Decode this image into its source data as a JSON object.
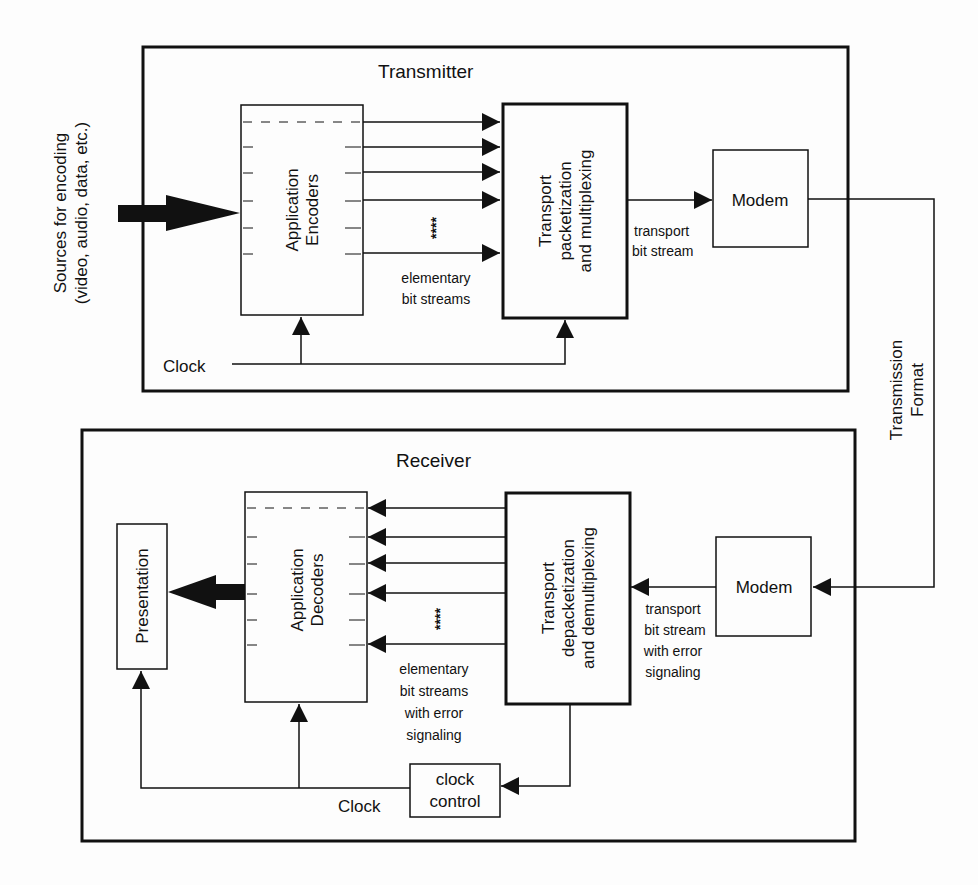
{
  "transmitter": {
    "title": "Transmitter",
    "sources_label_line1": "Sources for encoding",
    "sources_label_line2": "(video, audio, data, etc.)",
    "encoders_line1": "Application",
    "encoders_line2": "Encoders",
    "transport_line1": "Transport",
    "transport_line2": "packetization",
    "transport_line3": "and multiplexing",
    "modem": "Modem",
    "streams_ellipsis": "****",
    "elementary_line1": "elementary",
    "elementary_line2": "bit streams",
    "transport_bs_line1": "transport",
    "transport_bs_line2": "bit stream",
    "clock": "Clock"
  },
  "link": {
    "line1": "Transmission",
    "line2": "Format"
  },
  "receiver": {
    "title": "Receiver",
    "presentation": "Presentation",
    "decoders_line1": "Application",
    "decoders_line2": "Decoders",
    "transport_line1": "Transport",
    "transport_line2": "depacketization",
    "transport_line3": "and demultiplexing",
    "modem": "Modem",
    "streams_ellipsis": "****",
    "elementary_line1": "elementary",
    "elementary_line2": "bit streams",
    "elementary_line3": "with error",
    "elementary_line4": "signaling",
    "transport_bs_line1": "transport",
    "transport_bs_line2": "bit stream",
    "transport_bs_line3": "with error",
    "transport_bs_line4": "signaling",
    "clock_control_line1": "clock",
    "clock_control_line2": "control",
    "clock": "Clock"
  },
  "colors": {
    "ink": "#111111",
    "background": "#fdfdfd"
  }
}
